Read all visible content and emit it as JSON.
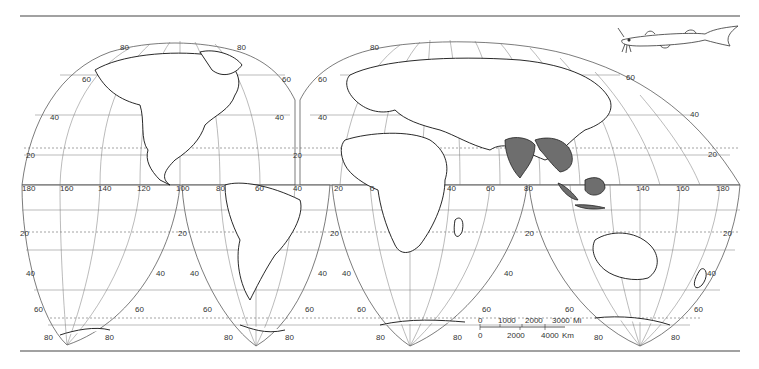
{
  "map": {
    "projection": "interrupted homolosine",
    "range_color": "#6e6e6e",
    "shaded_regions": [
      "India",
      "Indochina",
      "Sumatra",
      "Borneo",
      "Java"
    ],
    "illustration": "catfish-drawing"
  },
  "labels": {
    "lon_equator": [
      "180",
      "160",
      "140",
      "120",
      "100",
      "80",
      "60",
      "40",
      "20",
      "0",
      "20",
      "40",
      "60",
      "80",
      "120",
      "140",
      "160",
      "180"
    ],
    "lobe1": {
      "n80a": "80",
      "n80b": "80",
      "n60a": "60",
      "n60b": "60",
      "n40a": "40",
      "n40b": "40",
      "n20a": "20",
      "n20b": "20"
    },
    "lobe2": {
      "n80": "80",
      "n60a": "60",
      "n60b": "60",
      "n40a": "40",
      "n40b": "40",
      "n20": "20"
    },
    "south": {
      "s20a": "20",
      "s20b": "20",
      "s20c": "20",
      "s20d": "20",
      "s20e": "20",
      "s40a": "40",
      "s40b": "40",
      "s40c": "40",
      "s40d": "40",
      "s40e": "40",
      "s40f": "40",
      "s40g": "40",
      "s60a": "60",
      "s60b": "60",
      "s60c": "60",
      "s60d": "60",
      "s60e": "60",
      "s60f": "60",
      "s60g": "60",
      "s60h": "60",
      "s80a": "80",
      "s80b": "80",
      "s80c": "80",
      "s80d": "80",
      "s80e": "80",
      "s80f": "80",
      "s80g": "80",
      "s80h": "80"
    }
  },
  "scale_bar": {
    "miles": {
      "ticks": [
        "0",
        "1000",
        "2000",
        "3000"
      ],
      "unit": "Mi"
    },
    "km": {
      "ticks": [
        "0",
        "2000",
        "4000"
      ],
      "unit": "Km"
    }
  }
}
